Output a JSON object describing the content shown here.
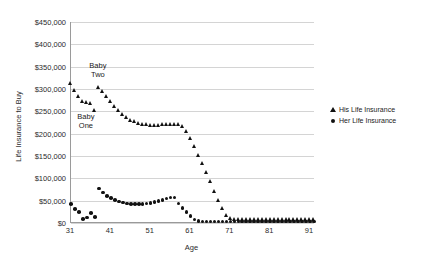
{
  "chart_data": {
    "type": "scatter",
    "title": "",
    "xlabel": "Age",
    "ylabel": "Life Insurance to Buy",
    "xlim": [
      31,
      92
    ],
    "ylim": [
      0,
      450000
    ],
    "xticks": [
      "31",
      "41",
      "51",
      "61",
      "71",
      "81",
      "91"
    ],
    "xtick_values": [
      31,
      41,
      51,
      61,
      71,
      81,
      91
    ],
    "yticks": [
      "$0",
      "$50,000",
      "$100,000",
      "$150,000",
      "$200,000",
      "$250,000",
      "$300,000",
      "$350,000",
      "$400,000",
      "$450,000"
    ],
    "ytick_values": [
      0,
      50000,
      100000,
      150000,
      200000,
      250000,
      300000,
      350000,
      400000,
      450000
    ],
    "grid": true,
    "legend_position": "right",
    "annotations": [
      {
        "text": "Baby\nTwo",
        "x": 38,
        "y": 352000
      },
      {
        "text": "Baby\nOne",
        "x": 35,
        "y": 238000
      }
    ],
    "series": [
      {
        "name": "His Life Insurance",
        "marker": "triangle",
        "color": "#111111",
        "x": [
          31,
          32,
          33,
          34,
          35,
          36,
          37,
          38,
          39,
          40,
          41,
          42,
          43,
          44,
          45,
          46,
          47,
          48,
          49,
          50,
          51,
          52,
          53,
          54,
          55,
          56,
          57,
          58,
          59,
          60,
          61,
          62,
          63,
          64,
          65,
          66,
          67,
          68,
          69,
          70,
          71,
          72,
          73,
          74,
          75,
          76,
          77,
          78,
          79,
          80,
          81,
          82,
          83,
          84,
          85,
          86,
          87,
          88,
          89,
          90,
          91,
          92
        ],
        "y": [
          312000,
          297000,
          285000,
          273000,
          270000,
          268000,
          252000,
          305000,
          296000,
          283000,
          272000,
          262000,
          252000,
          244000,
          237000,
          231000,
          227000,
          224000,
          222000,
          221000,
          220000,
          220000,
          220000,
          221000,
          221000,
          222000,
          222000,
          221000,
          216000,
          205000,
          190000,
          172000,
          152000,
          134000,
          114000,
          93000,
          71000,
          51000,
          33000,
          18000,
          10000,
          9000,
          9000,
          9000,
          9000,
          9000,
          9000,
          9000,
          9000,
          9000,
          9000,
          9000,
          9000,
          9000,
          9000,
          9000,
          9000,
          9000,
          9000,
          9000,
          9000,
          9000
        ]
      },
      {
        "name": "Her Life Insurance",
        "marker": "circle",
        "color": "#111111",
        "x": [
          31,
          32,
          33,
          34,
          35,
          36,
          37,
          38,
          39,
          40,
          41,
          42,
          43,
          44,
          45,
          46,
          47,
          48,
          49,
          50,
          51,
          52,
          53,
          54,
          55,
          56,
          57,
          58,
          59,
          60,
          61,
          62,
          63,
          64,
          65,
          66,
          67,
          68,
          69,
          70,
          71,
          72,
          73,
          74,
          75,
          76,
          77,
          78,
          79,
          80,
          81,
          82,
          83,
          84,
          85,
          86,
          87,
          88,
          89,
          90,
          91,
          92
        ],
        "y": [
          42000,
          31000,
          24000,
          9000,
          12000,
          22000,
          14000,
          77000,
          68000,
          61000,
          56000,
          52000,
          48000,
          46000,
          44000,
          43000,
          43000,
          43000,
          43000,
          44000,
          45000,
          47000,
          49000,
          52000,
          55000,
          57000,
          57000,
          44000,
          34000,
          25000,
          16000,
          8000,
          4000,
          3000,
          3000,
          3000,
          3000,
          3000,
          3000,
          3000,
          3000,
          3000,
          3000,
          3000,
          3000,
          3000,
          3000,
          3000,
          3000,
          3000,
          3000,
          3000,
          3000,
          3000,
          3000,
          3000,
          3000,
          3000,
          3000,
          3000,
          3000,
          3000
        ]
      }
    ]
  },
  "legend": {
    "items": [
      {
        "label": "His Life Insurance",
        "marker": "triangle"
      },
      {
        "label": "Her Life Insurance",
        "marker": "circle"
      }
    ]
  }
}
